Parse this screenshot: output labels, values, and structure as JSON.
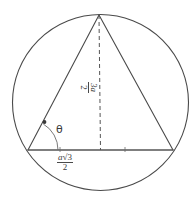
{
  "figure": {
    "name": "equilateral-triangle-inscribed-in-circle",
    "background_color": "#ffffff",
    "stroke_color": "#4a4a4a",
    "text_color": "#3c3c3c",
    "canvas": {
      "width": 195,
      "height": 205
    },
    "circle": {
      "cx": 100.5,
      "cy": 102.5,
      "r": 88,
      "dashed": false
    },
    "triangle": {
      "apex": {
        "x": 99,
        "y": 15
      },
      "left": {
        "x": 28,
        "y": 150
      },
      "right": {
        "x": 173,
        "y": 150
      }
    },
    "altitude": {
      "from": {
        "x": 99,
        "y": 15
      },
      "to": {
        "x": 100.5,
        "y": 150
      },
      "dashed": true
    },
    "angle_arc": {
      "vertex": {
        "x": 28,
        "y": 150
      },
      "radius": 30,
      "marker_dot": {
        "x": 47,
        "y": 127
      }
    }
  },
  "labels": {
    "base": {
      "name": "base-length-label",
      "numerator_variable": "a",
      "numerator_radical": "√3",
      "denominator": "2",
      "plain": "a√3/2"
    },
    "height": {
      "name": "altitude-length-label",
      "numerator_leading": "3",
      "numerator_variable": "a",
      "denominator": "2",
      "plain": "3a/2",
      "rotation_degrees": 90
    },
    "theta": {
      "name": "angle-theta-label",
      "symbol": "θ"
    }
  }
}
